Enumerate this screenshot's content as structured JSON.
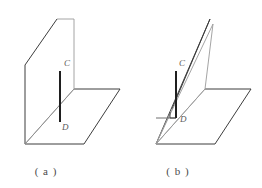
{
  "page": {
    "background_color": "#ffffff",
    "width": 262,
    "height": 188
  },
  "colors": {
    "edge_dark": "#3d3d3d",
    "edge_light": "#9a9a9a",
    "segment_dark": "#1f1f1f",
    "segment_helper": "#8c8c8c",
    "label_text": "#5a5a5a",
    "caption_text": "#4a4a4a",
    "face_fill": "#ffffff"
  },
  "figures": [
    {
      "id": "figure-a",
      "caption": "（a）",
      "caption_plain": "( a )",
      "description": "Vertical plane meeting a horizontal plane; segment CD lies in the vertical plane and is perpendicular to the intersection line at D",
      "labels": [
        {
          "name": "point-label-c",
          "text": "C",
          "x": 64,
          "y": 66
        },
        {
          "name": "point-label-d",
          "text": "D",
          "x": 62,
          "y": 128
        }
      ],
      "segments": [
        {
          "name": "segment-cd",
          "from": "C",
          "to": "D",
          "style": "thick"
        }
      ],
      "planes": [
        {
          "name": "vertical-plane",
          "kind": "parallelogram"
        },
        {
          "name": "horizontal-plane",
          "kind": "parallelogram"
        }
      ]
    },
    {
      "id": "figure-b",
      "caption": "（b）",
      "caption_plain": "( b )",
      "description": "Slanted plane meeting a horizontal plane; segment CD is vertical with a right-angle mark at D and a helper segment to the lower-left vertex",
      "labels": [
        {
          "name": "point-label-c",
          "text": "C",
          "x": 176,
          "y": 66
        },
        {
          "name": "point-label-d",
          "text": "D",
          "x": 182,
          "y": 124
        }
      ],
      "segments": [
        {
          "name": "segment-cd",
          "from": "C",
          "to": "D",
          "style": "thick"
        },
        {
          "name": "segment-helper-to-d",
          "from": "A",
          "to": "D",
          "style": "thin"
        }
      ],
      "marks": [
        {
          "name": "right-angle-mark-d",
          "at": "D",
          "type": "square"
        }
      ],
      "planes": [
        {
          "name": "slanted-plane",
          "kind": "parallelogram"
        },
        {
          "name": "horizontal-plane",
          "kind": "parallelogram"
        }
      ]
    }
  ]
}
